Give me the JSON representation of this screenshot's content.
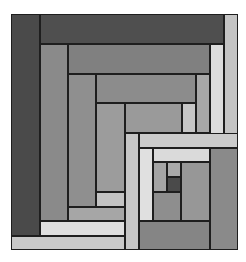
{
  "figure": {
    "title": "",
    "frame": {
      "x": 11,
      "y": 14,
      "w": 227,
      "h": 236
    },
    "palette": {
      "darkest": "#3c3c3c",
      "dark": "#555555",
      "mid_dark": "#7a7a7a",
      "mid": "#8c8c8c",
      "mid_light": "#9e9e9e",
      "light": "#bdbdbd",
      "lighter": "#cfcfcf",
      "lightest": "#dedede"
    },
    "blocks": [
      {
        "id": "left-outer-column",
        "x": 11,
        "y": 14,
        "w": 29,
        "h": 222,
        "color": "#4a4a4a"
      },
      {
        "id": "top-outer-bar",
        "x": 40,
        "y": 14,
        "w": 184,
        "h": 30,
        "color": "#4f4f4f"
      },
      {
        "id": "right-outer-column",
        "x": 224,
        "y": 14,
        "w": 14,
        "h": 134,
        "color": "#c4c4c4"
      },
      {
        "id": "left-col-2",
        "x": 40,
        "y": 44,
        "w": 28,
        "h": 177,
        "color": "#8a8a8a"
      },
      {
        "id": "top-bar-2",
        "x": 68,
        "y": 44,
        "w": 142,
        "h": 30,
        "color": "#808080"
      },
      {
        "id": "right-col-2",
        "x": 210,
        "y": 44,
        "w": 14,
        "h": 104,
        "color": "#dcdcdc"
      },
      {
        "id": "left-col-3",
        "x": 68,
        "y": 74,
        "w": 28,
        "h": 133,
        "color": "#8f8f8f"
      },
      {
        "id": "top-bar-3",
        "x": 96,
        "y": 74,
        "w": 100,
        "h": 29,
        "color": "#8c8c8c"
      },
      {
        "id": "right-col-3",
        "x": 196,
        "y": 74,
        "w": 14,
        "h": 59,
        "color": "#a8a8a8"
      },
      {
        "id": "left-col-4",
        "x": 96,
        "y": 103,
        "w": 29,
        "h": 89,
        "color": "#9c9c9c"
      },
      {
        "id": "top-bar-4",
        "x": 125,
        "y": 103,
        "w": 57,
        "h": 30,
        "color": "#9a9a9a"
      },
      {
        "id": "right-col-4",
        "x": 182,
        "y": 103,
        "w": 14,
        "h": 30,
        "color": "#c6c6c6"
      },
      {
        "id": "bottom-bar-4",
        "x": 96,
        "y": 192,
        "w": 29,
        "h": 15,
        "color": "#c3c3c3"
      },
      {
        "id": "bottom-bar-3",
        "x": 68,
        "y": 207,
        "w": 57,
        "h": 14,
        "color": "#a6a6a6"
      },
      {
        "id": "bottom-bar-2",
        "x": 40,
        "y": 221,
        "w": 85,
        "h": 15,
        "color": "#dedede"
      },
      {
        "id": "bottom-outer-bar",
        "x": 11,
        "y": 236,
        "w": 114,
        "h": 14,
        "color": "#c9c9c9"
      },
      {
        "id": "inner-left-column",
        "x": 125,
        "y": 133,
        "w": 14,
        "h": 117,
        "color": "#c6c6c6"
      },
      {
        "id": "inner-top-bar",
        "x": 139,
        "y": 133,
        "w": 99,
        "h": 15,
        "color": "#cbcbcb"
      },
      {
        "id": "inner-col-2",
        "x": 139,
        "y": 148,
        "w": 14,
        "h": 73,
        "color": "#e0e0e0"
      },
      {
        "id": "inner-bar-2",
        "x": 153,
        "y": 148,
        "w": 57,
        "h": 14,
        "color": "#dadada"
      },
      {
        "id": "inner-right-column",
        "x": 210,
        "y": 148,
        "w": 28,
        "h": 102,
        "color": "#8a8a8a"
      },
      {
        "id": "core-left",
        "x": 153,
        "y": 162,
        "w": 14,
        "h": 30,
        "color": "#a4a4a4"
      },
      {
        "id": "core-top",
        "x": 167,
        "y": 162,
        "w": 14,
        "h": 15,
        "color": "#a9a9a9"
      },
      {
        "id": "core-center",
        "x": 167,
        "y": 177,
        "w": 14,
        "h": 15,
        "color": "#4a4a4a"
      },
      {
        "id": "core-right",
        "x": 181,
        "y": 162,
        "w": 29,
        "h": 59,
        "color": "#979797"
      },
      {
        "id": "core-bottom",
        "x": 153,
        "y": 192,
        "w": 28,
        "h": 29,
        "color": "#8e8e8e"
      },
      {
        "id": "inner-bottom-bar",
        "x": 139,
        "y": 221,
        "w": 71,
        "h": 29,
        "color": "#858585"
      }
    ]
  }
}
